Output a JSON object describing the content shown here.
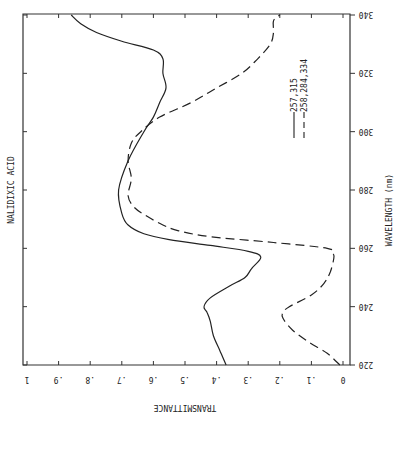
{
  "chart_data": {
    "type": "line",
    "title": "NALIDIXIC ACID",
    "xlabel": "WAVELENGTH (nm)",
    "ylabel": "TRANSMITTANCE",
    "orientation_note": "figure is rotated; wavelength runs vertically, transmittance horizontally",
    "xlim": [
      220,
      340
    ],
    "ylim": [
      0,
      1
    ],
    "x_ticks": [
      220,
      240,
      260,
      280,
      300,
      320,
      340
    ],
    "y_ticks": [
      0,
      0.1,
      0.2,
      0.3,
      0.4,
      0.5,
      0.6,
      0.7,
      0.8,
      0.9,
      1
    ],
    "y_tick_labels": [
      "0",
      ".1",
      ".2",
      ".3",
      ".4",
      ".5",
      ".6",
      ".7",
      ".8",
      ".9",
      "1"
    ],
    "grid": false,
    "legend_position": "inside, upper right (rotated)",
    "series": [
      {
        "name": "257,315",
        "style": "solid",
        "x": [
          220,
          225,
          230,
          235,
          238,
          240,
          243,
          247,
          250,
          253,
          257,
          259,
          261,
          263,
          265,
          268,
          272,
          280,
          290,
          300,
          305,
          310,
          315,
          320,
          325,
          328,
          331,
          334,
          337,
          340
        ],
        "y": [
          0.37,
          0.39,
          0.41,
          0.42,
          0.43,
          0.44,
          0.42,
          0.36,
          0.31,
          0.29,
          0.26,
          0.3,
          0.42,
          0.55,
          0.63,
          0.68,
          0.7,
          0.71,
          0.68,
          0.63,
          0.6,
          0.58,
          0.56,
          0.57,
          0.57,
          0.6,
          0.7,
          0.78,
          0.83,
          0.86
        ]
      },
      {
        "name": "258,284,334",
        "style": "dashed",
        "x": [
          220,
          224,
          228,
          232,
          236,
          238,
          240,
          244,
          248,
          252,
          256,
          258,
          260,
          262,
          264,
          266,
          268,
          271,
          274,
          278,
          284,
          290,
          296,
          300,
          305,
          310,
          315,
          320,
          325,
          330,
          334,
          338,
          340
        ],
        "y": [
          0.01,
          0.05,
          0.11,
          0.16,
          0.19,
          0.19,
          0.17,
          0.1,
          0.06,
          0.04,
          0.03,
          0.03,
          0.05,
          0.22,
          0.42,
          0.52,
          0.57,
          0.62,
          0.66,
          0.68,
          0.67,
          0.68,
          0.67,
          0.64,
          0.58,
          0.48,
          0.4,
          0.32,
          0.27,
          0.23,
          0.22,
          0.22,
          0.2
        ]
      }
    ]
  }
}
